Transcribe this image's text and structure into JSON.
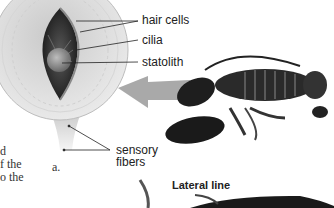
{
  "figure": {
    "panel_label": "a.",
    "labels": {
      "hair_cells": "hair cells",
      "cilia": "cilia",
      "statolith": "statolith",
      "sensory_fibers_line1": "sensory",
      "sensory_fibers_line2": "fibers"
    },
    "section_title": "Lateral line",
    "body_text_fragments": [
      "d",
      "f the",
      "o the"
    ],
    "subjects": [
      "statocyst-cross-section",
      "lobster",
      "fish"
    ],
    "colors": {
      "arrow": "#9a9a9a",
      "line": "#222222",
      "dark": "#1a1a1a"
    }
  }
}
